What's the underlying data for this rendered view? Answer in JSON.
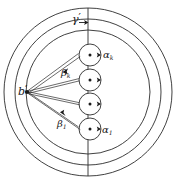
{
  "figure": {
    "background": "#ffffff",
    "stroke_color": "#2b2b2b",
    "label_color": "#1a1a1a",
    "width": 177,
    "height": 183
  },
  "labels": {
    "gamma_prime": "γ",
    "gamma_prime_mark": "′",
    "alpha_k_base": "α",
    "alpha_k_sub": "k",
    "alpha_1_base": "α",
    "alpha_1_sub": "1",
    "beta_k_base": "β",
    "beta_k_sub": "k",
    "beta_1_base": "β",
    "beta_1_sub": "1",
    "b_prime": "b",
    "b_prime_mark": "′"
  },
  "geometry": {
    "center": {
      "x": 88,
      "y": 92
    },
    "outer_circles": [
      {
        "name": "circle-outer",
        "radius": 84
      },
      {
        "name": "circle-middle",
        "radius": 73
      },
      {
        "name": "circle-inner",
        "radius": 62
      }
    ],
    "vertical_axis": {
      "x": 88,
      "y1": 8,
      "y2": 176
    },
    "source_point": {
      "name": "b-prime",
      "x": 27,
      "y": 92
    },
    "nodes": [
      {
        "name": "node-alpha-k",
        "cx": 90,
        "cy": 55,
        "r": 11
      },
      {
        "name": "node-2",
        "cx": 90,
        "cy": 80,
        "r": 11
      },
      {
        "name": "node-3",
        "cx": 90,
        "cy": 104,
        "r": 11
      },
      {
        "name": "node-alpha-1",
        "cx": 90,
        "cy": 129,
        "r": 11
      }
    ]
  }
}
